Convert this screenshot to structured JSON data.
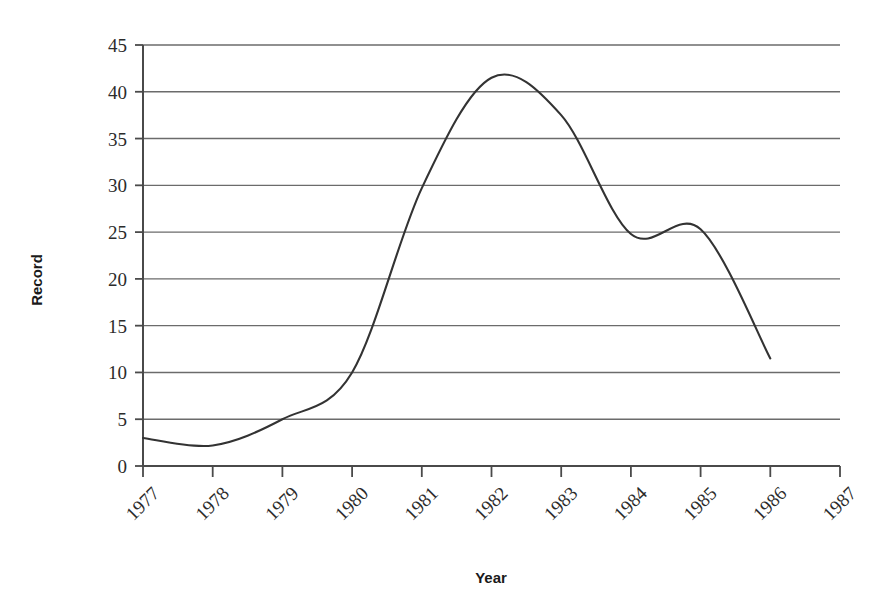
{
  "chart_data": {
    "type": "line",
    "title": "",
    "subtitle": "",
    "xlabel": "Year",
    "ylabel": "Record",
    "xlim": [
      1977,
      1987
    ],
    "ylim": [
      0,
      45
    ],
    "grid": "horizontal",
    "legend": "none",
    "smoothing": "spline",
    "line_color": "#333333",
    "grid_color": "#6b6b6b",
    "axis_color": "#4a4a4a",
    "x_tick_labels": [
      "1977",
      "1978",
      "1979",
      "1980",
      "1981",
      "1982",
      "1983",
      "1984",
      "1985",
      "1986",
      "1987"
    ],
    "x_tick_values": [
      1977,
      1978,
      1979,
      1980,
      1981,
      1982,
      1983,
      1984,
      1985,
      1986,
      1987
    ],
    "x_tick_rotation_deg": -45,
    "y_tick_labels": [
      "0",
      "5",
      "10",
      "15",
      "20",
      "25",
      "30",
      "35",
      "40",
      "45"
    ],
    "y_tick_values": [
      0,
      5,
      10,
      15,
      20,
      25,
      30,
      35,
      40,
      45
    ],
    "series": [
      {
        "name": "Record",
        "x": [
          1977,
          1978,
          1979,
          1980,
          1981,
          1982,
          1983,
          1984,
          1985,
          1986
        ],
        "values": [
          3.0,
          2.2,
          5.0,
          10.0,
          29.7,
          41.5,
          37.5,
          24.8,
          25.3,
          11.5
        ]
      }
    ],
    "annotations": [
      {
        "label": "peak",
        "x": 1982.2,
        "y": 42.2
      },
      {
        "label": "minimum",
        "x": 1978.1,
        "y": 2.2
      },
      {
        "label": "local-dip",
        "x": 1984.1,
        "y": 24.5
      },
      {
        "label": "local-bump",
        "x": 1984.8,
        "y": 25.5
      }
    ]
  }
}
